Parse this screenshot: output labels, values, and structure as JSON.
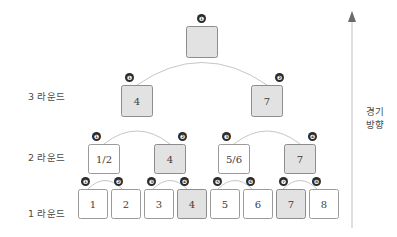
{
  "diagram": {
    "colors": {
      "shaded_fill": "#e2e2e2",
      "plain_fill": "#ffffff",
      "box_border": "#9a9a9a",
      "badge_fill": "#2b2b2b",
      "badge_text": "#ffffff",
      "arc_stroke": "#c6c6c6",
      "text": "#4a4a4a",
      "background": "#ffffff"
    }
  },
  "round_labels": [
    {
      "id": "round-3",
      "text": "3 라운드"
    },
    {
      "id": "round-2",
      "text": "2 라운드"
    },
    {
      "id": "round-1",
      "text": "1 라운드"
    }
  ],
  "direction": {
    "line1": "경기",
    "line2": "방향",
    "arrow": "up-arrow-icon"
  },
  "rounds": {
    "champion": {
      "nodes": [
        {
          "label": "",
          "shaded": true,
          "empty": true,
          "badge": "❶"
        }
      ]
    },
    "round3": {
      "nodes": [
        {
          "label": "4",
          "shaded": true,
          "empty": false,
          "badge": "❶"
        },
        {
          "label": "7",
          "shaded": true,
          "empty": false,
          "badge": "❷"
        }
      ]
    },
    "round2": {
      "nodes": [
        {
          "label": "1/2",
          "shaded": false,
          "empty": false,
          "badge": "❶"
        },
        {
          "label": "4",
          "shaded": true,
          "empty": false,
          "badge": "❷"
        },
        {
          "label": "5/6",
          "shaded": false,
          "empty": false,
          "badge": "❸"
        },
        {
          "label": "7",
          "shaded": true,
          "empty": false,
          "badge": "❹"
        }
      ]
    },
    "round1": {
      "nodes": [
        {
          "label": "1",
          "shaded": false,
          "empty": false,
          "badge": "❶"
        },
        {
          "label": "2",
          "shaded": false,
          "empty": false,
          "badge": "❷"
        },
        {
          "label": "3",
          "shaded": false,
          "empty": false,
          "badge": "❸"
        },
        {
          "label": "4",
          "shaded": true,
          "empty": false,
          "badge": "❹"
        },
        {
          "label": "5",
          "shaded": false,
          "empty": false,
          "badge": "❺"
        },
        {
          "label": "6",
          "shaded": false,
          "empty": false,
          "badge": "❻"
        },
        {
          "label": "7",
          "shaded": true,
          "empty": false,
          "badge": "❼"
        },
        {
          "label": "8",
          "shaded": false,
          "empty": false,
          "badge": "❽"
        }
      ]
    }
  }
}
